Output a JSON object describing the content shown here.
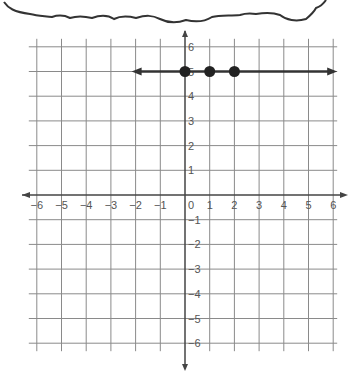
{
  "chart_data": {
    "type": "line",
    "title": "",
    "xlabel": "",
    "ylabel": "",
    "xlim": [
      -6,
      6
    ],
    "ylim": [
      -6,
      6
    ],
    "grid": true,
    "x_ticks": [
      "−6",
      "−5",
      "−4",
      "−3",
      "−2",
      "−1",
      "0",
      "1",
      "2",
      "3",
      "4",
      "5",
      "6"
    ],
    "y_ticks": [
      "6",
      "5",
      "4",
      "3",
      "2",
      "1",
      "−1",
      "−2",
      "−3",
      "−4",
      "−5",
      "−6"
    ],
    "series": [
      {
        "name": "y = 5",
        "kind": "line-with-arrows",
        "equation": "y = 5",
        "x_range": [
          -2,
          6
        ],
        "points": [
          {
            "x": 0,
            "y": 5
          },
          {
            "x": 1,
            "y": 5
          },
          {
            "x": 2,
            "y": 5
          }
        ]
      }
    ]
  },
  "decorations": {
    "cloud_bubble": "top thought-bubble outline (partially visible)"
  },
  "colors": {
    "grid": "#8a8a8a",
    "axis": "#444444",
    "line": "#333333",
    "point": "#222222",
    "label": "#555555"
  }
}
